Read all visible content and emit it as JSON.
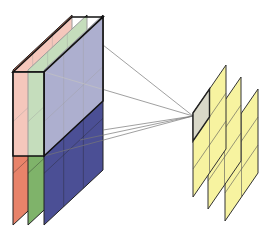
{
  "diagram": {
    "input_volume": {
      "channels": [
        {
          "name": "red-channel",
          "color": "#e8836a"
        },
        {
          "name": "green-channel",
          "color": "#7fb36a"
        },
        {
          "name": "blue-channel",
          "color": "#4b4f95"
        }
      ],
      "grid_columns": 3,
      "grid_rows": 3
    },
    "kernel": {
      "face_color": "#ffffff",
      "face_opacity": 0.55,
      "outline_color": "#111111"
    },
    "connection_lines": {
      "count": 5,
      "color": "#777777"
    },
    "output_maps": {
      "count": 3,
      "color": "#f7f3a0",
      "highlight_cell_color": "#d9d8c8",
      "grid_columns": 2,
      "grid_rows": 3
    }
  }
}
